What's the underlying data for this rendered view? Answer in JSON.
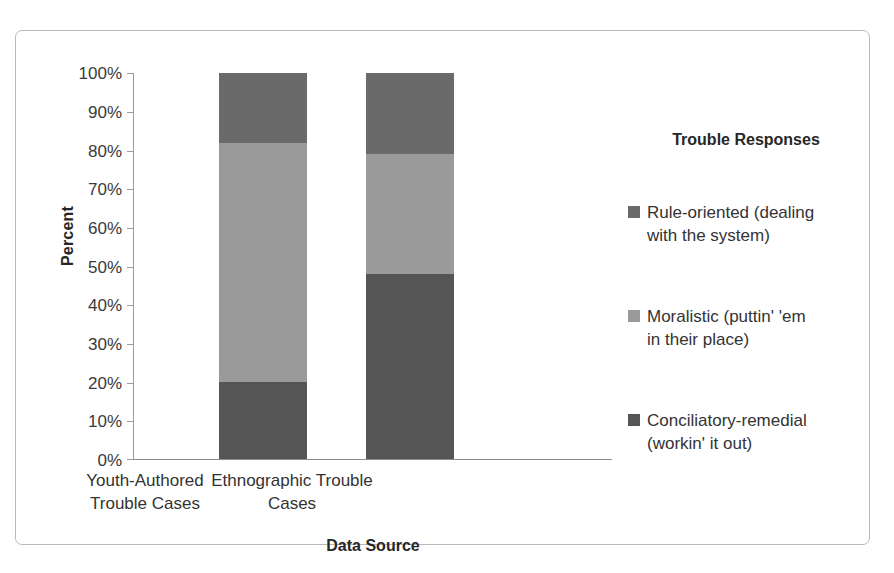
{
  "chart_data": {
    "type": "bar",
    "subtype": "100% stacked bar",
    "title": "",
    "xlabel": "Data Source",
    "ylabel": "Percent",
    "ylim": [
      0,
      100
    ],
    "yticks": [
      "0%",
      "10%",
      "20%",
      "30%",
      "40%",
      "50%",
      "60%",
      "70%",
      "80%",
      "90%",
      "100%"
    ],
    "ytick_values": [
      0,
      10,
      20,
      30,
      40,
      50,
      60,
      70,
      80,
      90,
      100
    ],
    "grid": false,
    "legend_position": "right",
    "legend_title": "Trouble Responses",
    "categories": [
      "Youth-Authored Trouble Cases",
      "Ethnographic Trouble Cases"
    ],
    "series": [
      {
        "name": "Conciliatory-remedial (workin' it out)",
        "color": "#555555",
        "values": [
          20,
          48
        ]
      },
      {
        "name": "Moralistic (puttin' 'em in their place)",
        "color": "#9a9a9a",
        "values": [
          62,
          31
        ]
      },
      {
        "name": "Rule-oriented (dealing with the system)",
        "color": "#6a6a6a",
        "values": [
          18,
          21
        ]
      }
    ]
  },
  "axis": {
    "y_title": "Percent",
    "x_title": "Data Source",
    "y_labels": [
      "100%",
      "90%",
      "80%",
      "70%",
      "60%",
      "50%",
      "40%",
      "30%",
      "20%",
      "10%",
      "0%"
    ],
    "x_labels": [
      {
        "line1": "Youth-Authored",
        "line2": "Trouble Cases"
      },
      {
        "line1": "Ethnographic Trouble",
        "line2": "Cases"
      }
    ]
  },
  "legend": {
    "title": "Trouble Responses",
    "items": [
      {
        "label": "Rule-oriented (dealing with the system)",
        "line1": "Rule-oriented (dealing",
        "line2": "with the system)",
        "color": "#6a6a6a"
      },
      {
        "label": "Moralistic (puttin' 'em in their place)",
        "line1": "Moralistic (puttin' 'em",
        "line2": "in their place)",
        "color": "#9a9a9a"
      },
      {
        "label": "Conciliatory-remedial (workin' it out)",
        "line1": "Conciliatory-remedial",
        "line2": "(workin' it out)",
        "color": "#555555"
      }
    ]
  },
  "colors": {
    "frame_border": "#b9b9b9",
    "axis_line": "#9b9b9b",
    "text": "#333333",
    "background": "#ffffff"
  }
}
